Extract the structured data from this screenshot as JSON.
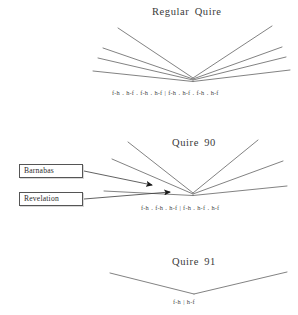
{
  "figure": {
    "background": "#ffffff",
    "line_color": "#6b6b6b",
    "arrow_color": "#1a1a1a",
    "box_border_color": "#555555"
  },
  "sections": [
    {
      "id": "regular-quire",
      "title": "Regular Quire",
      "formula": "f-h . h-f . f-h . h-f | f-h . h-f . f-h . h-f",
      "bifolia_count": 4
    },
    {
      "id": "quire-90",
      "title": "Quire 90",
      "formula": "f-h . f-h . h-f | f-h . h-f . h-f",
      "bifolia_count": 3
    },
    {
      "id": "quire-91",
      "title": "Quire 91",
      "formula": "f-h | h-f",
      "bifolia_count": 1
    }
  ],
  "annotations": [
    {
      "id": "barnabas",
      "label": "Barnabas"
    },
    {
      "id": "revelation",
      "label": "Revelation"
    }
  ]
}
